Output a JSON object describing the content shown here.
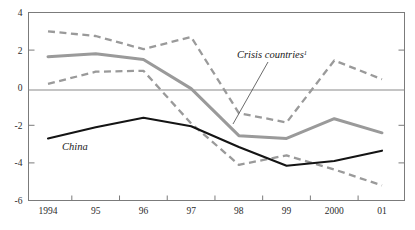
{
  "chart_data": {
    "type": "line",
    "title": "",
    "subtitle": "",
    "xlabel": "",
    "ylabel": "",
    "categories": [
      "1994",
      "95",
      "96",
      "97",
      "98",
      "99",
      "2000",
      "01"
    ],
    "x_tick_labels": [
      "1994",
      "95",
      "96",
      "97",
      "98",
      "99",
      "2000",
      "01"
    ],
    "y_tick_labels": [
      "4",
      "2",
      "0",
      "-2",
      "-4",
      "-6"
    ],
    "y_tick_values": [
      4,
      2,
      0,
      -2,
      -4,
      -6
    ],
    "ylim": [
      -6,
      4
    ],
    "grid": false,
    "zero_line": true,
    "legend": "inline-annotations",
    "series": [
      {
        "name": "China",
        "style": "solid",
        "color": "#141414",
        "values": [
          -2.7,
          -2.1,
          -1.6,
          -2.05,
          -3.15,
          -4.15,
          -3.9,
          -3.35
        ]
      },
      {
        "name": "Crisis countries",
        "style": "solid",
        "color": "#9a9a9a",
        "values": [
          1.65,
          1.8,
          1.5,
          -0.05,
          -2.55,
          -2.7,
          -1.65,
          -2.4
        ]
      },
      {
        "name": "Crisis countries upper band",
        "style": "dashed",
        "color": "#9a9a9a",
        "values": [
          3.0,
          2.75,
          2.05,
          2.7,
          -1.35,
          -1.85,
          1.45,
          0.45
        ]
      },
      {
        "name": "Crisis countries lower band",
        "style": "dashed",
        "color": "#9a9a9a",
        "values": [
          0.2,
          0.85,
          0.9,
          -1.9,
          -4.1,
          -3.6,
          -4.35,
          -5.2
        ]
      }
    ],
    "annotations": [
      {
        "id": "crisis-countries",
        "text": "Crisis countries",
        "superscript": "1",
        "x": 237,
        "y": 58,
        "leader_from": [
          268,
          62
        ],
        "leader_to": [
          233,
          124
        ]
      },
      {
        "id": "china",
        "text": "China",
        "superscript": "",
        "x": 62,
        "y": 150,
        "leader_from": null,
        "leader_to": null
      }
    ]
  },
  "colors": {
    "china_line": "#141414",
    "crisis_line": "#9a9a9a",
    "band_line": "#9a9a9a",
    "axis": "#7b7b7b",
    "background": "#ffffff"
  }
}
